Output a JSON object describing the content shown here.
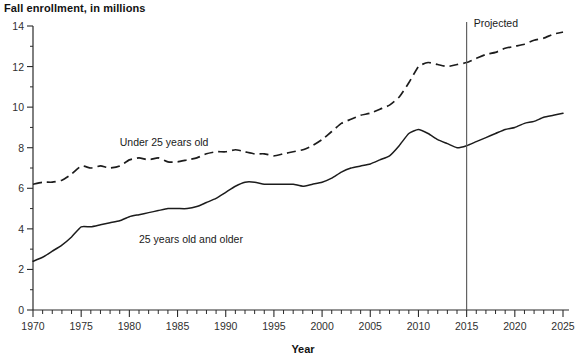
{
  "chart_data": {
    "type": "line",
    "title": "Fall enrollment, in millions",
    "xlabel": "Year",
    "ylabel": "",
    "xlim": [
      1970,
      2025
    ],
    "ylim": [
      0,
      14
    ],
    "grid": false,
    "legend_position": "inline-labels",
    "y_ticks_major": [
      0,
      2,
      4,
      6,
      8,
      10,
      12,
      14
    ],
    "y_ticks_minor": [
      1,
      3,
      5,
      7,
      9,
      11,
      13
    ],
    "x_ticks_major": [
      1970,
      1975,
      1980,
      1985,
      1990,
      1995,
      2000,
      2005,
      2010,
      2015,
      2020,
      2025
    ],
    "x_tick_labels": [
      "1970",
      "1975",
      "1980",
      "1985",
      "1990",
      "1995",
      "2000",
      "2005",
      "2010",
      "2015",
      "2020",
      "2025"
    ],
    "y_tick_labels": [
      "0",
      "2",
      "4",
      "6",
      "8",
      "10",
      "12",
      "14"
    ],
    "annotations": [
      {
        "text": "Projected",
        "x": 2015,
        "kind": "vertical-divider-label"
      }
    ],
    "projection_start_year": 2015,
    "x": [
      1970,
      1971,
      1972,
      1973,
      1974,
      1975,
      1976,
      1977,
      1978,
      1979,
      1980,
      1981,
      1982,
      1983,
      1984,
      1985,
      1986,
      1987,
      1988,
      1989,
      1990,
      1991,
      1992,
      1993,
      1994,
      1995,
      1996,
      1997,
      1998,
      1999,
      2000,
      2001,
      2002,
      2003,
      2004,
      2005,
      2006,
      2007,
      2008,
      2009,
      2010,
      2011,
      2012,
      2013,
      2014,
      2015,
      2016,
      2017,
      2018,
      2019,
      2020,
      2021,
      2022,
      2023,
      2024,
      2025
    ],
    "series": [
      {
        "name": "Under 25 years old",
        "style": "dashed",
        "label_x": 1979,
        "label_y": 8.1,
        "values": [
          6.2,
          6.3,
          6.3,
          6.4,
          6.7,
          7.1,
          7.0,
          7.1,
          7.0,
          7.1,
          7.4,
          7.5,
          7.4,
          7.5,
          7.3,
          7.3,
          7.4,
          7.5,
          7.7,
          7.8,
          7.8,
          7.9,
          7.8,
          7.7,
          7.7,
          7.6,
          7.7,
          7.8,
          7.9,
          8.1,
          8.4,
          8.8,
          9.2,
          9.4,
          9.6,
          9.7,
          9.9,
          10.1,
          10.5,
          11.2,
          12.0,
          12.2,
          12.1,
          12.0,
          12.1,
          12.2,
          12.4,
          12.6,
          12.7,
          12.9,
          13.0,
          13.1,
          13.3,
          13.4,
          13.6,
          13.7
        ]
      },
      {
        "name": "25 years old and older",
        "style": "solid",
        "label_x": 1981,
        "label_y": 3.3,
        "values": [
          2.4,
          2.6,
          2.9,
          3.2,
          3.6,
          4.1,
          4.1,
          4.2,
          4.3,
          4.4,
          4.6,
          4.7,
          4.8,
          4.9,
          5.0,
          5.0,
          5.0,
          5.1,
          5.3,
          5.5,
          5.8,
          6.1,
          6.3,
          6.3,
          6.2,
          6.2,
          6.2,
          6.2,
          6.1,
          6.2,
          6.3,
          6.5,
          6.8,
          7.0,
          7.1,
          7.2,
          7.4,
          7.6,
          8.1,
          8.7,
          8.9,
          8.7,
          8.4,
          8.2,
          8.0,
          8.1,
          8.3,
          8.5,
          8.7,
          8.9,
          9.0,
          9.2,
          9.3,
          9.5,
          9.6,
          9.7
        ]
      }
    ]
  }
}
